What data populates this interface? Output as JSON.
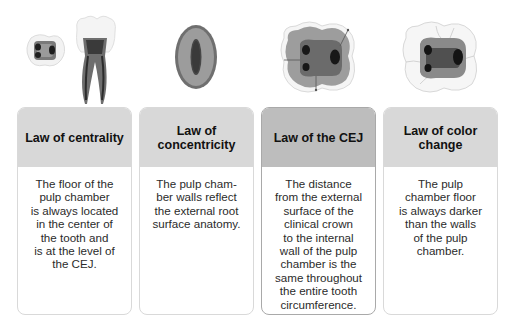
{
  "colors": {
    "header_bg": "#d8d8d8",
    "header_bg_highlight": "#bdbdbd",
    "card_border": "#d9d9d9",
    "card_border_highlight": "#a9a9a9",
    "title_text": "#111111",
    "body_text": "#2b2b2b"
  },
  "cards": [
    {
      "title": "Law of centrality",
      "illustration": "molar-crown-and-root-section-icon",
      "body_lines": [
        "The floor of the",
        "pulp chamber",
        "is always located",
        "in the center of",
        "the tooth and",
        "is at the level of",
        "the CEJ."
      ]
    },
    {
      "title_lines": [
        "Law of",
        "concentricity"
      ],
      "illustration": "root-cross-section-icon",
      "body_lines": [
        "The pulp cham-",
        "ber walls reflect",
        "the external root",
        "surface anatomy."
      ]
    },
    {
      "title": "Law of the CEJ",
      "illustration": "crown-cross-section-cej-icon",
      "highlighted": true,
      "body_lines": [
        "The distance",
        "from the external",
        "surface of the",
        "clinical crown",
        "to the internal",
        "wall of the pulp",
        "chamber is the",
        "same throughout",
        "the entire tooth",
        "circumference."
      ]
    },
    {
      "title_lines": [
        "Law of color",
        "change"
      ],
      "illustration": "pulp-floor-color-icon",
      "body_lines": [
        "The pulp",
        "chamber floor",
        "is always darker",
        "than the walls",
        "of the pulp",
        "chamber."
      ]
    }
  ]
}
